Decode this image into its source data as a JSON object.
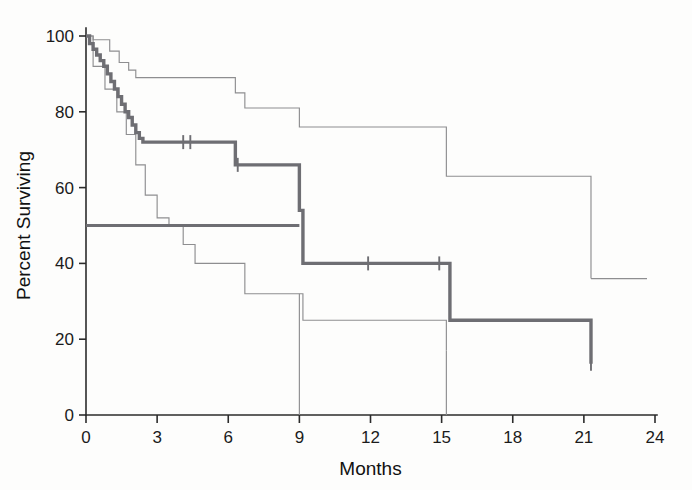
{
  "figure": {
    "background": "#fdfdfc",
    "main_color": "#6e6e73",
    "ci_color": "#8e8e90",
    "axis_color": "#2b2b2b"
  },
  "axes": {
    "x_title": "Months",
    "y_title": "Percent Surviving",
    "x_ticks": [
      "0",
      "3",
      "6",
      "9",
      "12",
      "15",
      "18",
      "21",
      "24"
    ],
    "y_ticks": [
      "0",
      "20",
      "40",
      "60",
      "80",
      "100"
    ]
  },
  "chart_data": {
    "type": "line",
    "title": "",
    "subtitle": "",
    "xlabel": "Months",
    "ylabel": "Percent Surviving",
    "xlim": [
      0,
      24
    ],
    "ylim": [
      0,
      100
    ],
    "xticks": [
      0,
      3,
      6,
      9,
      12,
      15,
      18,
      21,
      24
    ],
    "yticks": [
      0,
      20,
      40,
      60,
      80,
      100
    ],
    "grid": false,
    "legend": "none",
    "plot_style": "kaplan-meier-step",
    "annotations": [
      {
        "name": "median-reference-line",
        "description": "Horizontal reference line drawn at 50 percent survival from month 0 to month 9",
        "y": 50,
        "x_start": 0,
        "x_end": 9.0
      }
    ],
    "series": [
      {
        "name": "Survival estimate",
        "style": "thick step curve",
        "color": "#6e6e73",
        "x": [
          0,
          0.15,
          0.3,
          0.45,
          0.6,
          0.75,
          0.9,
          1.05,
          1.2,
          1.35,
          1.5,
          1.65,
          1.8,
          1.95,
          2.1,
          2.25,
          2.4,
          4.2,
          6.3,
          6.6,
          9.0,
          9.15,
          15.15,
          15.35,
          21.3
        ],
        "y": [
          100,
          98,
          96.5,
          95,
          93.5,
          92,
          90,
          88,
          86,
          84,
          82,
          80,
          78.5,
          76.5,
          74.5,
          73,
          72,
          72,
          66,
          66,
          54,
          40,
          40,
          25,
          13.5
        ],
        "censor_times": [
          4.1,
          4.4,
          6.4,
          11.9,
          14.9,
          21.3
        ],
        "censor_values": [
          72,
          72,
          66,
          40,
          40,
          13.5
        ]
      },
      {
        "name": "Upper 95% confidence limit",
        "style": "thin step curve",
        "color": "#8e8e90",
        "x": [
          0,
          0.3,
          1.0,
          1.4,
          1.8,
          2.1,
          2.5,
          4.1,
          6.3,
          6.7,
          9.0,
          15.2,
          21.3
        ],
        "y": [
          100,
          99,
          96,
          93,
          91,
          89,
          89,
          89,
          85,
          81,
          76,
          63,
          36
        ]
      },
      {
        "name": "Lower 95% confidence limit",
        "style": "thin step curve",
        "color": "#8e8e90",
        "x": [
          0,
          0.3,
          0.8,
          1.3,
          1.7,
          2.1,
          2.5,
          3.0,
          3.5,
          4.1,
          4.6,
          6.3,
          6.7,
          9.0,
          9.15,
          15.2
        ],
        "y": [
          100,
          92,
          86,
          80,
          74,
          66,
          58,
          52,
          50,
          45,
          40,
          40,
          32,
          32,
          25,
          17
        ]
      }
    ]
  },
  "notes": {
    "upper_band_end_value": "36",
    "lower_band_end_value": "17",
    "main_curve_end_value": "13.5",
    "lower_band_drop_month": "9",
    "main_curve_drop_month": "15"
  }
}
